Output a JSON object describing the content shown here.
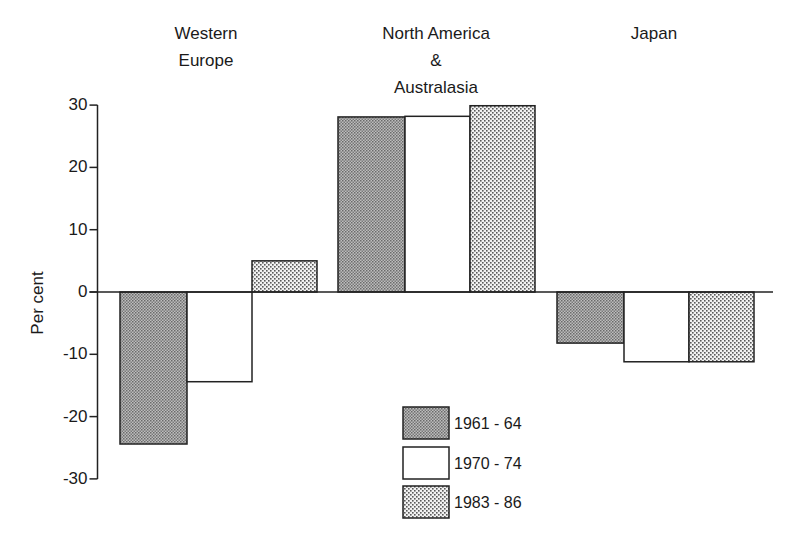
{
  "chart_data": {
    "type": "bar",
    "title": "",
    "xlabel": "",
    "ylabel": "Per cent",
    "ylim": [
      -30,
      30
    ],
    "yticks": [
      30,
      20,
      10,
      0,
      -10,
      -20,
      -30
    ],
    "ytick_labels": [
      "30",
      "20",
      "10",
      "0",
      "-10",
      "-20",
      "-30"
    ],
    "grid": false,
    "legend_position": "bottom-center",
    "categories": [
      "Western Europe",
      "North America & Australasia",
      "Japan"
    ],
    "category_label_lines": [
      [
        "Western",
        "Europe"
      ],
      [
        "North America",
        "&",
        "Australasia"
      ],
      [
        "Japan"
      ]
    ],
    "series": [
      {
        "name": "1961 - 64",
        "values": [
          -24.4,
          28.1,
          -8.2
        ],
        "fill": "dense-gray-pattern",
        "color": "#9a9a9a"
      },
      {
        "name": "1970 - 74",
        "values": [
          -14.4,
          28.2,
          -11.2
        ],
        "fill": "white",
        "color": "#ffffff"
      },
      {
        "name": "1983 - 86",
        "values": [
          5.0,
          29.9,
          -11.2
        ],
        "fill": "light-dot-pattern",
        "color": "#d4d4d4"
      }
    ]
  },
  "legend": {
    "items": [
      {
        "label": "1961 - 64"
      },
      {
        "label": "1970 - 74"
      },
      {
        "label": "1983 - 86"
      }
    ]
  }
}
